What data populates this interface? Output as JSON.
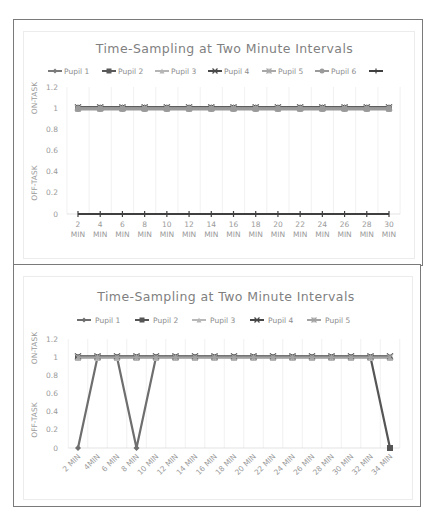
{
  "chart_data": [
    {
      "type": "line",
      "title": "Time-Sampling at Two Minute Intervals",
      "xlabel": "",
      "ylabel_top": "ON-TASK",
      "ylabel_bottom": "OFF-TASK",
      "ylim": [
        0,
        1.2
      ],
      "yticks": [
        "0",
        "0.2",
        "0.4",
        "0.6",
        "0.8",
        "1",
        "1.2"
      ],
      "grid": "vertical",
      "legend_position": "top",
      "categories": [
        "2 MIN",
        "4 MIN",
        "6 MIN",
        "8 MIN",
        "10 MIN",
        "12 MIN",
        "14 MIN",
        "16 MIN",
        "18 MIN",
        "20 MIN",
        "22 MIN",
        "24 MIN",
        "26 MIN",
        "28 MIN",
        "30 MIN"
      ],
      "category_lines": [
        [
          "2",
          "MIN"
        ],
        [
          "4",
          "MIN"
        ],
        [
          "6",
          "MIN"
        ],
        [
          "8",
          "MIN"
        ],
        [
          "10",
          "MIN"
        ],
        [
          "12",
          "MIN"
        ],
        [
          "14",
          "MIN"
        ],
        [
          "16",
          "MIN"
        ],
        [
          "18",
          "MIN"
        ],
        [
          "20",
          "MIN"
        ],
        [
          "22",
          "MIN"
        ],
        [
          "24",
          "MIN"
        ],
        [
          "26",
          "MIN"
        ],
        [
          "28",
          "MIN"
        ],
        [
          "30",
          "MIN"
        ]
      ],
      "series": [
        {
          "name": "Pupil 1",
          "color": "#7a7a7a",
          "marker": "diamond",
          "values": [
            1,
            1,
            1,
            1,
            1,
            1,
            1,
            1,
            1,
            1,
            1,
            1,
            1,
            1,
            1
          ]
        },
        {
          "name": "Pupil 2",
          "color": "#595959",
          "marker": "square",
          "values": [
            1,
            1,
            1,
            1,
            1,
            1,
            1,
            1,
            1,
            1,
            1,
            1,
            1,
            1,
            1
          ]
        },
        {
          "name": "Pupil 3",
          "color": "#b5b5b5",
          "marker": "triangle",
          "values": [
            1,
            1,
            1,
            1,
            1,
            1,
            1,
            1,
            1,
            1,
            1,
            1,
            1,
            1,
            1
          ]
        },
        {
          "name": "Pupil 4",
          "color": "#4a4a4a",
          "marker": "x",
          "values": [
            1,
            1,
            1,
            1,
            1,
            1,
            1,
            1,
            1,
            1,
            1,
            1,
            1,
            1,
            1
          ]
        },
        {
          "name": "Pupil 5",
          "color": "#a8a8a8",
          "marker": "star",
          "values": [
            1,
            1,
            1,
            1,
            1,
            1,
            1,
            1,
            1,
            1,
            1,
            1,
            1,
            1,
            1
          ]
        },
        {
          "name": "Pupil 6",
          "color": "#9a9a9a",
          "marker": "circle",
          "values": [
            1,
            1,
            1,
            1,
            1,
            1,
            1,
            1,
            1,
            1,
            1,
            1,
            1,
            1,
            1
          ]
        },
        {
          "name": "",
          "color": "#3f3f3f",
          "marker": "plus",
          "values": [
            0,
            0,
            0,
            0,
            0,
            0,
            0,
            0,
            0,
            0,
            0,
            0,
            0,
            0,
            0
          ]
        }
      ]
    },
    {
      "type": "line",
      "title": "Time-Sampling at Two Minute Intervals",
      "xlabel": "",
      "ylabel_top": "ON-TASK",
      "ylabel_bottom": "OFF-TASK",
      "ylim": [
        0,
        1.2
      ],
      "yticks": [
        "0",
        "0.2",
        "0.4",
        "0.6",
        "0.8",
        "1",
        "1.2"
      ],
      "grid": "vertical",
      "legend_position": "top",
      "categories": [
        "2 MIN",
        "4MIN",
        "6 MIN",
        "8 MIN",
        "10 MIN",
        "12 MIN",
        "14 MIN",
        "16 MIN",
        "18 MIN",
        "20 MIN",
        "22 MIN",
        "24 MIN",
        "26 MIN",
        "28 MIN",
        "30 MIN",
        "32 MIN",
        "34 MIN"
      ],
      "series": [
        {
          "name": "Pupil 1",
          "color": "#6e6e6e",
          "marker": "diamond",
          "values": [
            0,
            1,
            1,
            0,
            1,
            1,
            1,
            1,
            1,
            1,
            1,
            1,
            1,
            1,
            1,
            1,
            1
          ]
        },
        {
          "name": "Pupil 2",
          "color": "#555555",
          "marker": "square",
          "values": [
            1,
            1,
            1,
            1,
            1,
            1,
            1,
            1,
            1,
            1,
            1,
            1,
            1,
            1,
            1,
            1,
            0
          ]
        },
        {
          "name": "Pupil 3",
          "color": "#b8b8b8",
          "marker": "triangle",
          "values": [
            1,
            1,
            1,
            1,
            1,
            1,
            1,
            1,
            1,
            1,
            1,
            1,
            1,
            1,
            1,
            1,
            1
          ]
        },
        {
          "name": "Pupil 4",
          "color": "#474747",
          "marker": "x",
          "values": [
            1,
            1,
            1,
            1,
            1,
            1,
            1,
            1,
            1,
            1,
            1,
            1,
            1,
            1,
            1,
            1,
            1
          ]
        },
        {
          "name": "Pupil 5",
          "color": "#a3a3a3",
          "marker": "star",
          "values": [
            1,
            1,
            1,
            1,
            1,
            1,
            1,
            1,
            1,
            1,
            1,
            1,
            1,
            1,
            1,
            1,
            1
          ]
        }
      ]
    }
  ]
}
